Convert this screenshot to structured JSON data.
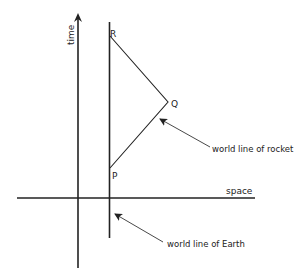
{
  "diagram": {
    "axes": {
      "time_label": "time",
      "space_label": "space"
    },
    "points": {
      "P": "P",
      "Q": "Q",
      "R": "R"
    },
    "annotations": {
      "rocket": "world line of rocket",
      "earth": "world line of Earth"
    },
    "colors": {
      "ink": "#222222",
      "background": "#ffffff"
    }
  }
}
